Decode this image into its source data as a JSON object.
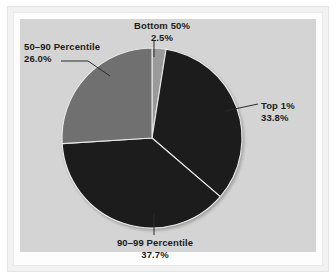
{
  "chart_data": {
    "type": "pie",
    "title": "",
    "categories": [
      "Bottom 50%",
      "Top 1%",
      "90–99 Percentile",
      "50–90 Percentile"
    ],
    "values": [
      2.5,
      33.8,
      37.7,
      26.0
    ],
    "unit": "%",
    "start_angle_deg": 0,
    "direction": "clockwise",
    "legend": "none",
    "labels_position": "outside-with-leader-lines",
    "slices": [
      {
        "name": "Bottom 50%",
        "label": "Bottom 50%",
        "percent_label": "2.5%",
        "value": 2.5,
        "color": "#9a9a9a"
      },
      {
        "name": "Top 1%",
        "label": "Top 1%",
        "percent_label": "33.8%",
        "value": 33.8,
        "color": "#1b1b1b"
      },
      {
        "name": "90-99 Percentile",
        "label": "90–99 Percentile",
        "percent_label": "37.7%",
        "value": 37.7,
        "color": "#1b1b1b"
      },
      {
        "name": "50-90 Percentile",
        "label": "50–90 Percentile",
        "percent_label": "26.0%",
        "value": 26.0,
        "color": "#6f6f6f"
      }
    ]
  },
  "figure": {
    "panel_background": "#d4d4d4",
    "page_background": "#ffffff",
    "text_color": "#1c1c1c",
    "leader_line_color": "#2b2b2b",
    "slice_edge_color": "#e8e8e8"
  }
}
